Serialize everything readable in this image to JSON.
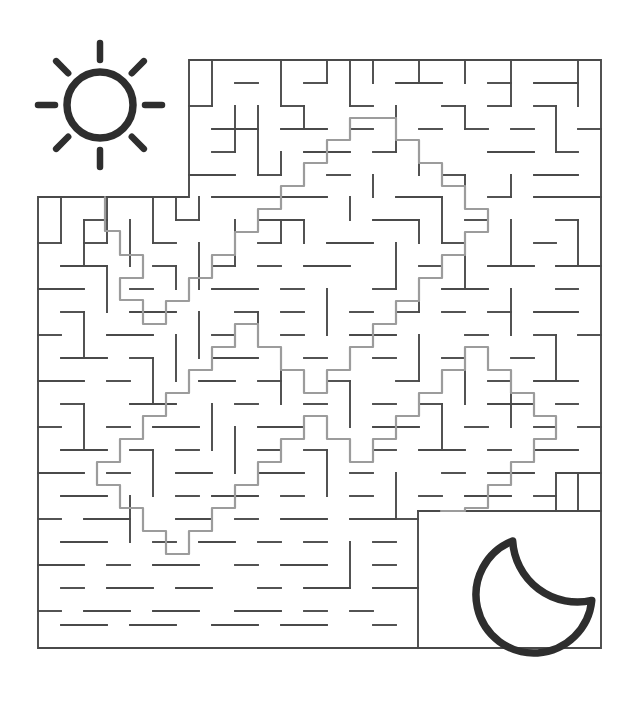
{
  "page": {
    "title": "Maze Puzzle: Sun to Moon",
    "width": 639,
    "height": 715,
    "background_color": "#ffffff"
  },
  "colors": {
    "maze_wall": "#4a4a4a",
    "solution_path": "#9c9c9c",
    "icon_dark": "#2e2e2e",
    "background": "#ffffff"
  },
  "stroke_widths": {
    "maze_wall": 1.9,
    "solution_path": 2.2,
    "sun_ring": 7.5,
    "sun_ray": 6.5,
    "moon": 7.5
  },
  "maze": {
    "name": "sun-to-moon-maze",
    "cell_size": 22.9,
    "origin_x": 38,
    "origin_y": 60,
    "grid_columns": 24,
    "grid_rows": 26,
    "wall_color": "#4a4a4a",
    "outline_segments": [
      "M 189 60 L 601 60 L 601 648 L 38 648 L 38 197 L 189 197 L 189 60",
      "M 418 511 L 601 511",
      "M 418 511 L 418 648"
    ],
    "entrance": {
      "label": "start",
      "x": 105,
      "y": 197,
      "side": "top-left"
    },
    "exit": {
      "label": "finish",
      "x": 441,
      "y": 511,
      "side": "bottom-right"
    },
    "interior_walls": [
      "M 212 60 L 212 106",
      "M 235 83 L 258 83",
      "M 281 60 L 281 106",
      "M 304 83 L 327 83",
      "M 327 60 L 327 83",
      "M 350 60 L 350 106",
      "M 373 60 L 373 83",
      "M 396 83 L 442 83",
      "M 419 60 L 419 83",
      "M 465 60 L 465 83",
      "M 488 83 L 511 83",
      "M 511 60 L 511 106",
      "M 534 83 L 578 83",
      "M 578 60 L 578 106",
      "M 189 106 L 212 106",
      "M 235 106 L 235 152",
      "M 258 106 L 258 129",
      "M 281 106 L 304 106",
      "M 304 106 L 304 129",
      "M 350 106 L 373 106",
      "M 396 106 L 396 152",
      "M 442 106 L 465 106",
      "M 465 106 L 465 129",
      "M 488 106 L 511 106",
      "M 534 106 L 556 106",
      "M 556 106 L 556 152",
      "M 212 129 L 258 129",
      "M 258 129 L 258 175",
      "M 281 129 L 327 129",
      "M 350 129 L 373 129",
      "M 419 129 L 442 129",
      "M 465 129 L 488 129",
      "M 511 129 L 534 129",
      "M 578 129 L 601 129",
      "M 212 152 L 235 152",
      "M 281 152 L 281 175",
      "M 304 152 L 350 152",
      "M 373 152 L 396 152",
      "M 419 152 L 419 175",
      "M 488 152 L 534 152",
      "M 556 152 L 578 152",
      "M 189 175 L 235 175",
      "M 258 175 L 281 175",
      "M 327 175 L 350 175",
      "M 373 175 L 373 197",
      "M 442 175 L 465 175",
      "M 465 175 L 465 197",
      "M 511 175 L 511 197",
      "M 534 175 L 578 175",
      "M 212 197 L 327 197",
      "M 350 197 L 350 220",
      "M 396 197 L 442 197",
      "M 488 197 L 511 197",
      "M 534 197 L 601 197",
      "M 61 197 L 61 243",
      "M 84 220 L 107 220",
      "M 107 197 L 107 243",
      "M 130 220 L 130 266",
      "M 153 197 L 153 243",
      "M 176 220 L 199 220",
      "M 235 220 L 235 266",
      "M 258 220 L 304 220",
      "M 281 220 L 281 243",
      "M 304 220 L 304 243",
      "M 373 220 L 419 220",
      "M 419 220 L 419 243",
      "M 465 220 L 488 220",
      "M 511 220 L 511 266",
      "M 556 220 L 578 220",
      "M 578 220 L 578 266",
      "M 38 243 L 61 243",
      "M 84 243 L 107 243",
      "M 153 243 L 176 243",
      "M 199 243 L 199 289",
      "M 258 243 L 281 243",
      "M 327 243 L 373 243",
      "M 396 243 L 396 289",
      "M 442 243 L 465 243",
      "M 465 243 L 465 289",
      "M 534 243 L 556 243",
      "M 61 266 L 107 266",
      "M 107 266 L 107 312",
      "M 153 266 L 176 266",
      "M 176 266 L 176 289",
      "M 212 266 L 235 266",
      "M 258 266 L 281 266",
      "M 304 266 L 350 266",
      "M 419 266 L 442 266",
      "M 488 266 L 534 266",
      "M 556 266 L 601 266",
      "M 38 289 L 84 289",
      "M 130 289 L 153 289",
      "M 212 289 L 258 289",
      "M 281 289 L 304 289",
      "M 327 289 L 327 335",
      "M 373 289 L 396 289",
      "M 419 289 L 419 312",
      "M 442 289 L 488 289",
      "M 511 289 L 511 335",
      "M 556 289 L 578 289",
      "M 61 312 L 84 312",
      "M 84 312 L 84 358",
      "M 130 312 L 176 312",
      "M 199 312 L 199 358",
      "M 235 312 L 258 312",
      "M 258 312 L 258 335",
      "M 281 312 L 304 312",
      "M 350 312 L 373 312",
      "M 396 312 L 419 312",
      "M 442 312 L 465 312",
      "M 488 312 L 511 312",
      "M 534 312 L 578 312",
      "M 38 335 L 61 335",
      "M 107 335 L 153 335",
      "M 176 335 L 176 381",
      "M 212 335 L 235 335",
      "M 281 335 L 304 335",
      "M 350 335 L 396 335",
      "M 419 335 L 419 381",
      "M 465 335 L 488 335",
      "M 534 335 L 556 335",
      "M 556 335 L 556 381",
      "M 578 335 L 601 335",
      "M 61 358 L 107 358",
      "M 130 358 L 153 358",
      "M 153 358 L 153 404",
      "M 212 358 L 258 358",
      "M 281 358 L 281 404",
      "M 304 358 L 327 358",
      "M 373 358 L 396 358",
      "M 442 358 L 465 358",
      "M 465 358 L 465 404",
      "M 511 358 L 534 358",
      "M 38 381 L 84 381",
      "M 107 381 L 130 381",
      "M 199 381 L 235 381",
      "M 258 381 L 281 381",
      "M 327 381 L 350 381",
      "M 350 381 L 350 427",
      "M 396 381 L 419 381",
      "M 488 381 L 511 381",
      "M 511 381 L 511 427",
      "M 534 381 L 578 381",
      "M 61 404 L 84 404",
      "M 84 404 L 84 450",
      "M 130 404 L 176 404",
      "M 212 404 L 212 450",
      "M 235 404 L 258 404",
      "M 304 404 L 327 404",
      "M 373 404 L 396 404",
      "M 419 404 L 442 404",
      "M 442 404 L 442 450",
      "M 488 404 L 534 404",
      "M 556 404 L 578 404",
      "M 38 427 L 61 427",
      "M 107 427 L 130 427",
      "M 153 427 L 199 427",
      "M 235 427 L 235 473",
      "M 258 427 L 304 427",
      "M 373 427 L 419 427",
      "M 465 427 L 488 427",
      "M 534 427 L 556 427",
      "M 578 427 L 601 427",
      "M 61 450 L 107 450",
      "M 130 450 L 153 450",
      "M 153 450 L 153 496",
      "M 176 450 L 199 450",
      "M 258 450 L 281 450",
      "M 304 450 L 327 450",
      "M 327 450 L 327 496",
      "M 373 450 L 396 450",
      "M 419 450 L 465 450",
      "M 488 450 L 511 450",
      "M 534 450 L 578 450",
      "M 38 473 L 84 473",
      "M 107 473 L 130 473",
      "M 176 473 L 212 473",
      "M 258 473 L 304 473",
      "M 350 473 L 373 473",
      "M 396 473 L 396 519",
      "M 442 473 L 465 473",
      "M 488 473 L 534 473",
      "M 556 473 L 601 473",
      "M 61 496 L 107 496",
      "M 130 496 L 130 542",
      "M 176 496 L 199 496",
      "M 212 496 L 258 496",
      "M 281 496 L 304 496",
      "M 350 496 L 373 496",
      "M 419 496 L 442 496",
      "M 465 496 L 511 496",
      "M 534 496 L 556 496",
      "M 38 519 L 61 519",
      "M 84 519 L 130 519",
      "M 176 519 L 212 519",
      "M 235 519 L 258 519",
      "M 281 519 L 327 519",
      "M 350 519 L 396 519",
      "M 61 542 L 107 542",
      "M 153 542 L 176 542",
      "M 199 542 L 235 542",
      "M 258 542 L 281 542",
      "M 304 542 L 327 542",
      "M 350 542 L 350 588",
      "M 373 542 L 396 542",
      "M 38 565 L 84 565",
      "M 107 565 L 130 565",
      "M 153 565 L 199 565",
      "M 235 565 L 258 565",
      "M 281 565 L 327 565",
      "M 373 565 L 396 565",
      "M 61 588 L 84 588",
      "M 107 588 L 153 588",
      "M 176 588 L 212 588",
      "M 258 588 L 281 588",
      "M 304 588 L 350 588",
      "M 373 588 L 418 588",
      "M 38 611 L 61 611",
      "M 84 611 L 130 611",
      "M 153 611 L 199 611",
      "M 235 611 L 281 611",
      "M 304 611 L 327 611",
      "M 350 611 L 373 611",
      "M 61 625 L 107 625",
      "M 130 625 L 176 625",
      "M 212 625 L 258 625",
      "M 281 625 L 327 625",
      "M 373 625 L 396 625",
      "M 84 220 L 84 266",
      "M 176 197 L 176 220",
      "M 199 197 L 199 220",
      "M 442 197 L 442 243",
      "M 556 473 L 556 511",
      "M 578 473 L 578 511",
      "M 396 519 L 418 519"
    ]
  },
  "solution": {
    "name": "maze-solution-path",
    "color": "#9c9c9c",
    "description": "Path from the sun at the top-left to the moon at the bottom-right",
    "path": "M 105 197 L 105 231 L 120 231 L 120 255 L 143 255 L 143 278 L 120 278 L 120 300 L 143 300 L 143 324 L 166 324 L 166 301 L 189 301 L 189 278 L 212 278 L 212 255 L 235 255 L 235 232 L 258 232 L 258 209 L 281 209 L 281 186 L 304 186 L 304 163 L 327 163 L 327 140 L 350 140 L 350 118 L 396 118 L 396 140 L 419 140 L 419 163 L 442 163 L 442 186 L 465 186 L 465 209 L 488 209 L 488 232 L 465 232 L 465 255 L 442 255 L 442 278 L 419 278 L 419 301 L 396 301 L 396 324 L 373 324 L 373 347 L 350 347 L 350 370 L 327 370 L 327 393 L 304 393 L 304 370 L 281 370 L 281 347 L 258 347 L 258 324 L 235 324 L 235 347 L 212 347 L 212 370 L 189 370 L 189 393 L 166 393 L 166 416 L 143 416 L 143 439 L 120 439 L 120 462 L 97 462 L 97 485 L 120 485 L 120 508 L 143 508 L 143 531 L 166 531 L 166 554 L 189 554 L 189 531 L 212 531 L 212 508 L 235 508 L 235 485 L 258 485 L 258 462 L 281 462 L 281 439 L 304 439 L 304 416 L 327 416 L 327 439 L 350 439 L 350 462 L 373 462 L 373 439 L 396 439 L 396 416 L 419 416 L 419 393 L 442 393 L 442 370 L 465 370 L 465 347 L 488 347 L 488 370 L 511 370 L 511 393 L 534 393 L 534 416 L 556 416 L 556 439 L 534 439 L 534 462 L 511 462 L 511 485 L 488 485 L 488 508 L 465 508 L 465 511 L 441 511"
  },
  "icons": [
    {
      "name": "sun-icon",
      "label": "Sun (start)",
      "center_x": 100,
      "center_y": 105,
      "ring_radius": 33,
      "ray_count": 8,
      "ray_inner_radius": 45,
      "ray_outer_radius": 62,
      "color": "#2e2e2e"
    },
    {
      "name": "moon-icon",
      "label": "Moon (finish)",
      "center_x": 534,
      "center_y": 595,
      "radius": 58,
      "color": "#2e2e2e"
    }
  ],
  "accessibility": {
    "alt_text": "A square maze puzzle with a sun icon at the top-left marking the start and a crescent moon at the bottom-right marking the finish. A light gray line traces the solution through the maze."
  }
}
